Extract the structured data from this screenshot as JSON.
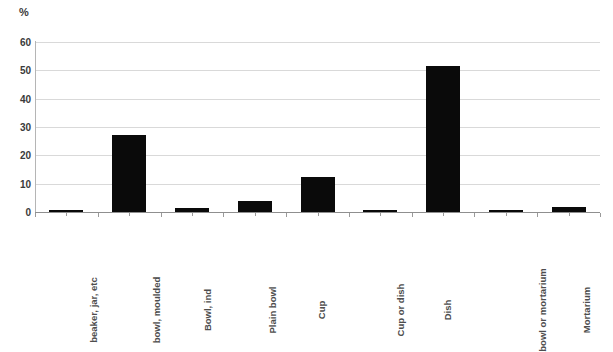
{
  "chart_data": {
    "type": "bar",
    "title": "",
    "subtitle": "",
    "xlabel": "",
    "ylabel": "%",
    "unit_label": "%",
    "ylim": [
      0,
      60
    ],
    "ytick_labels": [
      "0",
      "10",
      "20",
      "30",
      "40",
      "50",
      "60"
    ],
    "ytick_values": [
      0,
      10,
      20,
      30,
      40,
      50,
      60
    ],
    "grid": true,
    "grid_axis": "y",
    "legend": false,
    "legend_position": "none",
    "bar_color": "#0a0a0a",
    "grid_color": "#d9d9d9",
    "axis_color": "#8f8f8f",
    "label_color": "#4d4d4d",
    "categories": [
      "beaker, jar, etc",
      "bowl, moulded",
      "Bowl, ind",
      "Plain bowl",
      "Cup",
      "Cup or dish",
      "Dish",
      "bowl or mortarium",
      "Mortarium"
    ],
    "values": [
      0.7,
      27.2,
      1.3,
      4.0,
      12.2,
      0.5,
      51.5,
      0.15,
      1.6
    ]
  }
}
